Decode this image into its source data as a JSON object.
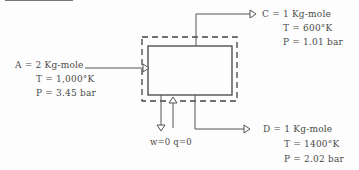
{
  "system": {
    "boundary": "dashed",
    "unit": "solid-box"
  },
  "streams": {
    "A": {
      "name": "A = 2 Kg-mole",
      "T": "T = 1,000°K",
      "P": "P = 3.45 bar",
      "direction": "inlet"
    },
    "C": {
      "name": "C = 1 Kg-mole",
      "T": "T = 600°K",
      "P": "P = 1.01 bar",
      "direction": "outlet"
    },
    "D": {
      "name": "D = 1 Kg-mole",
      "T": "T = 1400°K",
      "P": "P = 2.02 bar",
      "direction": "outlet"
    }
  },
  "energy": {
    "label": "w=0  q=0"
  },
  "colors": {
    "line": "#555555",
    "text": "#4a4a4a"
  }
}
